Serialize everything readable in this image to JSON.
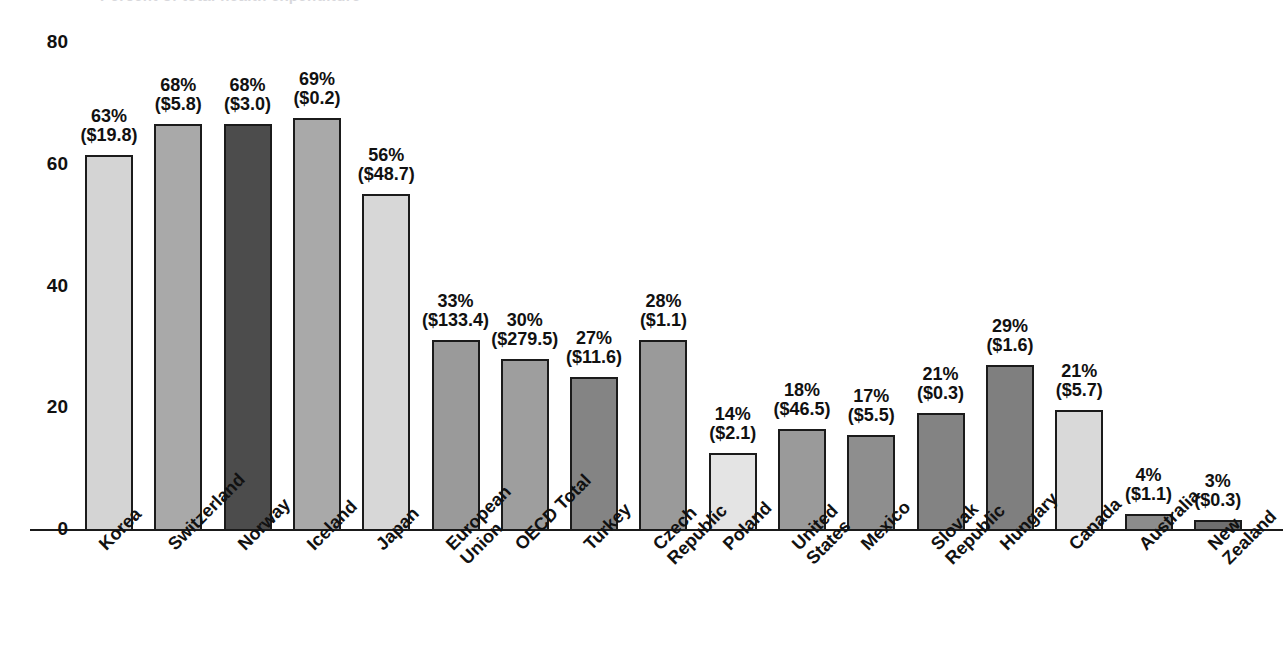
{
  "title": "Percent of total health expenditure",
  "chart_data": {
    "type": "bar",
    "title": "Percent of total health expenditure",
    "xlabel": "",
    "ylabel": "",
    "ylim": [
      0,
      80
    ],
    "yticks": [
      0,
      20,
      40,
      60,
      80
    ],
    "ytick_labels": [
      "0",
      "20",
      "40",
      "60",
      "80"
    ],
    "grid": false,
    "legend": null,
    "categories": [
      "Korea",
      "Switzerland",
      "Norway",
      "Iceland",
      "Japan",
      "European Union",
      "OECD Total",
      "Turkey",
      "Czech Republic",
      "Poland",
      "United States",
      "Mexico",
      "Slovak Republic",
      "Hungary",
      "Canada",
      "Australia",
      "New Zealand"
    ],
    "category_label_lines": [
      [
        "Korea"
      ],
      [
        "Switzerland"
      ],
      [
        "Norway"
      ],
      [
        "Iceland"
      ],
      [
        "Japan"
      ],
      [
        "European",
        "Union"
      ],
      [
        "OECD Total"
      ],
      [
        "Turkey"
      ],
      [
        "Czech",
        "Republic"
      ],
      [
        "Poland"
      ],
      [
        "United",
        "States"
      ],
      [
        "Mexico"
      ],
      [
        "Slovak",
        "Republic"
      ],
      [
        "Hungary"
      ],
      [
        "Canada"
      ],
      [
        "Australia"
      ],
      [
        "New",
        "Zealand"
      ]
    ],
    "values": [
      61.5,
      66.5,
      66.5,
      67.5,
      55,
      31,
      28,
      25,
      31,
      12.5,
      16.5,
      15.5,
      19,
      27,
      19.5,
      2.5,
      1.5
    ],
    "percent_labels": [
      "63%",
      "68%",
      "68%",
      "69%",
      "56%",
      "33%",
      "30%",
      "27%",
      "28%",
      "14%",
      "18%",
      "17%",
      "21%",
      "29%",
      "21%",
      "4%",
      "3%"
    ],
    "amount_labels": [
      "($19.8)",
      "($5.8)",
      "($3.0)",
      "($0.2)",
      "($48.7)",
      "($133.4)",
      "($279.5)",
      "($11.6)",
      "($1.1)",
      "($2.1)",
      "($46.5)",
      "($5.5)",
      "($0.3)",
      "($1.6)",
      "($5.7)",
      "($1.1)",
      "($0.3)"
    ],
    "bar_colors": [
      "#d4d4d4",
      "#a9a9a9",
      "#4c4c4c",
      "#a9a9a9",
      "#d7d7d7",
      "#9a9a9a",
      "#9e9e9e",
      "#848484",
      "#9a9a9a",
      "#e4e4e4",
      "#9a9a9a",
      "#8e8e8e",
      "#838383",
      "#7f7f7f",
      "#d9d9d9",
      "#8c8c8c",
      "#6f6f6f"
    ],
    "bar_outline_color": "#1b1b1b",
    "axis_color": "#1a1a1a"
  }
}
